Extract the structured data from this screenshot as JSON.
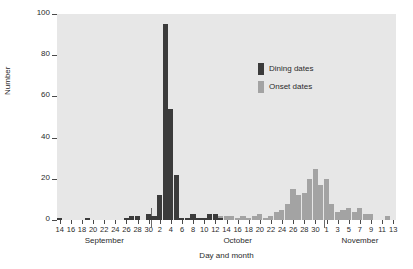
{
  "chart_data": {
    "type": "bar",
    "title": "",
    "xlabel": "Day and month",
    "ylabel": "Number",
    "ylim": [
      0,
      100
    ],
    "yticks": [
      0,
      20,
      40,
      60,
      80,
      100
    ],
    "grid": false,
    "legend_position": "upper-right-inside",
    "bar_style": "histogram-daily-bins",
    "colors": {
      "dining": "#3b3b3b",
      "onset": "#a3a3a3",
      "plot_background": "#e7e7e7",
      "page_background": "#ffffff",
      "axis": "#4a4a4a",
      "text": "#2b2b2b"
    },
    "legend": [
      {
        "label": "Dining dates",
        "color": "#3b3b3b"
      },
      {
        "label": "Onset dates",
        "color": "#a3a3a3"
      }
    ],
    "months": [
      {
        "name": "September",
        "start_index": 0,
        "end_index": 16
      },
      {
        "name": "October",
        "start_index": 17,
        "end_index": 47
      },
      {
        "name": "November",
        "start_index": 48,
        "end_index": 60
      }
    ],
    "month_separators": [
      17,
      48
    ],
    "xticks": [
      {
        "index": 0,
        "label": "14"
      },
      {
        "index": 2,
        "label": "16"
      },
      {
        "index": 4,
        "label": "18"
      },
      {
        "index": 6,
        "label": "20"
      },
      {
        "index": 8,
        "label": "22"
      },
      {
        "index": 10,
        "label": "24"
      },
      {
        "index": 12,
        "label": "26"
      },
      {
        "index": 14,
        "label": "28"
      },
      {
        "index": 16,
        "label": "30"
      },
      {
        "index": 18,
        "label": "2"
      },
      {
        "index": 20,
        "label": "4"
      },
      {
        "index": 22,
        "label": "6"
      },
      {
        "index": 24,
        "label": "8"
      },
      {
        "index": 26,
        "label": "10"
      },
      {
        "index": 28,
        "label": "12"
      },
      {
        "index": 30,
        "label": "14"
      },
      {
        "index": 32,
        "label": "16"
      },
      {
        "index": 34,
        "label": "18"
      },
      {
        "index": 36,
        "label": "20"
      },
      {
        "index": 38,
        "label": "22"
      },
      {
        "index": 40,
        "label": "24"
      },
      {
        "index": 42,
        "label": "26"
      },
      {
        "index": 44,
        "label": "28"
      },
      {
        "index": 46,
        "label": "30"
      },
      {
        "index": 48,
        "label": "1"
      },
      {
        "index": 50,
        "label": "3"
      },
      {
        "index": 52,
        "label": "5"
      },
      {
        "index": 54,
        "label": "7"
      },
      {
        "index": 56,
        "label": "9"
      },
      {
        "index": 58,
        "label": "11"
      },
      {
        "index": 60,
        "label": "13"
      }
    ],
    "categories": [
      "Sep 14",
      "Sep 15",
      "Sep 16",
      "Sep 17",
      "Sep 18",
      "Sep 19",
      "Sep 20",
      "Sep 21",
      "Sep 22",
      "Sep 23",
      "Sep 24",
      "Sep 25",
      "Sep 26",
      "Sep 27",
      "Sep 28",
      "Sep 29",
      "Sep 30",
      "Oct 1",
      "Oct 2",
      "Oct 3",
      "Oct 4",
      "Oct 5",
      "Oct 6",
      "Oct 7",
      "Oct 8",
      "Oct 9",
      "Oct 10",
      "Oct 11",
      "Oct 12",
      "Oct 13",
      "Oct 14",
      "Oct 15",
      "Oct 16",
      "Oct 17",
      "Oct 18",
      "Oct 19",
      "Oct 20",
      "Oct 21",
      "Oct 22",
      "Oct 23",
      "Oct 24",
      "Oct 25",
      "Oct 26",
      "Oct 27",
      "Oct 28",
      "Oct 29",
      "Oct 30",
      "Oct 31",
      "Nov 1",
      "Nov 2",
      "Nov 3",
      "Nov 4",
      "Nov 5",
      "Nov 6",
      "Nov 7",
      "Nov 8",
      "Nov 9",
      "Nov 10",
      "Nov 11",
      "Nov 12",
      "Nov 13"
    ],
    "series": [
      {
        "name": "Dining dates",
        "color": "#3b3b3b",
        "values": [
          1,
          0,
          0,
          0,
          0,
          1,
          0,
          0,
          0,
          0,
          0,
          0,
          1,
          2,
          2,
          0,
          3,
          2,
          12,
          95,
          54,
          22,
          1,
          1,
          3,
          1,
          1,
          3,
          3,
          1,
          0,
          0,
          0,
          0,
          0,
          0,
          0,
          0,
          0,
          0,
          0,
          0,
          0,
          0,
          0,
          0,
          0,
          0,
          0,
          0,
          0,
          0,
          0,
          0,
          0,
          0,
          0,
          0,
          0,
          0,
          0
        ]
      },
      {
        "name": "Onset dates",
        "color": "#a3a3a3",
        "values": [
          0,
          0,
          0,
          0,
          0,
          0,
          0,
          0,
          0,
          0,
          0,
          0,
          0,
          0,
          0,
          0,
          0,
          0,
          0,
          0,
          0,
          0,
          0,
          0,
          0,
          0,
          0,
          0,
          0,
          2,
          2,
          2,
          1,
          2,
          1,
          2,
          3,
          1,
          2,
          4,
          5,
          8,
          15,
          12,
          13,
          20,
          25,
          17,
          20,
          8,
          4,
          5,
          6,
          4,
          6,
          3,
          3,
          0,
          0,
          2,
          0
        ]
      }
    ]
  }
}
